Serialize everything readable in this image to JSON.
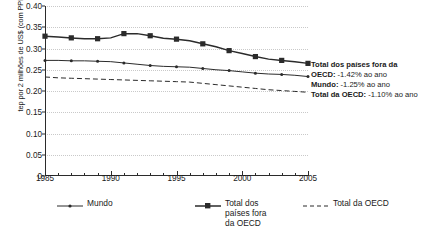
{
  "chart_data": {
    "type": "line",
    "title": "",
    "xlabel": "",
    "ylabel": "tep por 2 milhões de US$ (com PPP)",
    "xlim": [
      1985,
      2005
    ],
    "ylim": [
      0,
      0.4
    ],
    "grid": true,
    "legend_position": "bottom",
    "x": [
      1985,
      1986,
      1987,
      1988,
      1989,
      1990,
      1991,
      1992,
      1993,
      1994,
      1995,
      1996,
      1997,
      1998,
      1999,
      2000,
      2001,
      2002,
      2003,
      2004,
      2005
    ],
    "yticks": [
      "0",
      "0.05",
      "0.10",
      "0.15",
      "0.20",
      "0.25",
      "0.30",
      "0.35",
      "0.40"
    ],
    "ytick_values": [
      0,
      0.05,
      0.1,
      0.15,
      0.2,
      0.25,
      0.3,
      0.35,
      0.4
    ],
    "xticks": [
      "1985",
      "1990",
      "1995",
      "2000",
      "2005"
    ],
    "xtick_values": [
      1985,
      1990,
      1995,
      2000,
      2005
    ],
    "series": [
      {
        "name": "Mundo",
        "marker": "dot",
        "style": "solid",
        "values": [
          0.272,
          0.272,
          0.271,
          0.271,
          0.27,
          0.269,
          0.266,
          0.263,
          0.26,
          0.258,
          0.257,
          0.256,
          0.253,
          0.25,
          0.248,
          0.245,
          0.242,
          0.24,
          0.239,
          0.237,
          0.234
        ]
      },
      {
        "name": "Total dos países fora da OECD",
        "marker": "square",
        "style": "solid",
        "values": [
          0.329,
          0.327,
          0.325,
          0.323,
          0.323,
          0.325,
          0.335,
          0.335,
          0.33,
          0.324,
          0.322,
          0.318,
          0.311,
          0.304,
          0.295,
          0.288,
          0.281,
          0.275,
          0.272,
          0.269,
          0.265
        ]
      },
      {
        "name": "Total da OECD",
        "marker": "none",
        "style": "dashed",
        "values": [
          0.233,
          0.231,
          0.23,
          0.229,
          0.228,
          0.227,
          0.226,
          0.225,
          0.224,
          0.223,
          0.222,
          0.221,
          0.218,
          0.215,
          0.212,
          0.209,
          0.206,
          0.203,
          0.201,
          0.199,
          0.197
        ]
      }
    ],
    "annotations": [
      {
        "label": "Total dos países fora da OECD:",
        "value": "-1.42% ao ano",
        "series": "Total dos países fora da OECD"
      },
      {
        "label": "Mundo:",
        "value": "-1.25% ao ano",
        "series": "Mundo"
      },
      {
        "label": "Total da OECD:",
        "value": "-1.10% ao ano",
        "series": "Total da OECD"
      }
    ]
  },
  "legend": {
    "items": [
      {
        "label": "Mundo"
      },
      {
        "label": "Total dos países fora da OECD"
      },
      {
        "label": "Total da OECD"
      }
    ]
  },
  "colors": {
    "ink": "#2b2b2b",
    "grid": "#c9c9c9",
    "text": "#1a1a1a"
  }
}
